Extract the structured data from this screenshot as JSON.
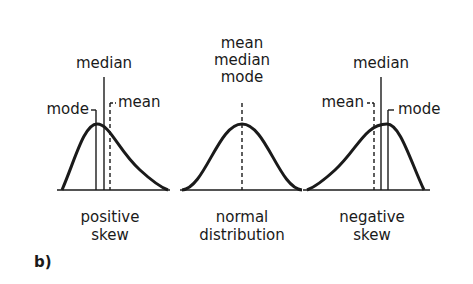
{
  "panel_label": "b)",
  "colors": {
    "stroke": "#1a1a1a",
    "background": "#ffffff"
  },
  "panels": [
    {
      "id": "positive",
      "caption_line1": "positive",
      "caption_line2": "skew",
      "labels": {
        "median": "median",
        "mode": "mode",
        "mean": "mean"
      }
    },
    {
      "id": "normal",
      "caption_line1": "normal",
      "caption_line2": "distribution",
      "labels": {
        "line1": "mean",
        "line2": "median",
        "line3": "mode"
      }
    },
    {
      "id": "negative",
      "caption_line1": "negative",
      "caption_line2": "skew",
      "labels": {
        "median": "median",
        "mean": "mean",
        "mode": "mode"
      }
    }
  ]
}
